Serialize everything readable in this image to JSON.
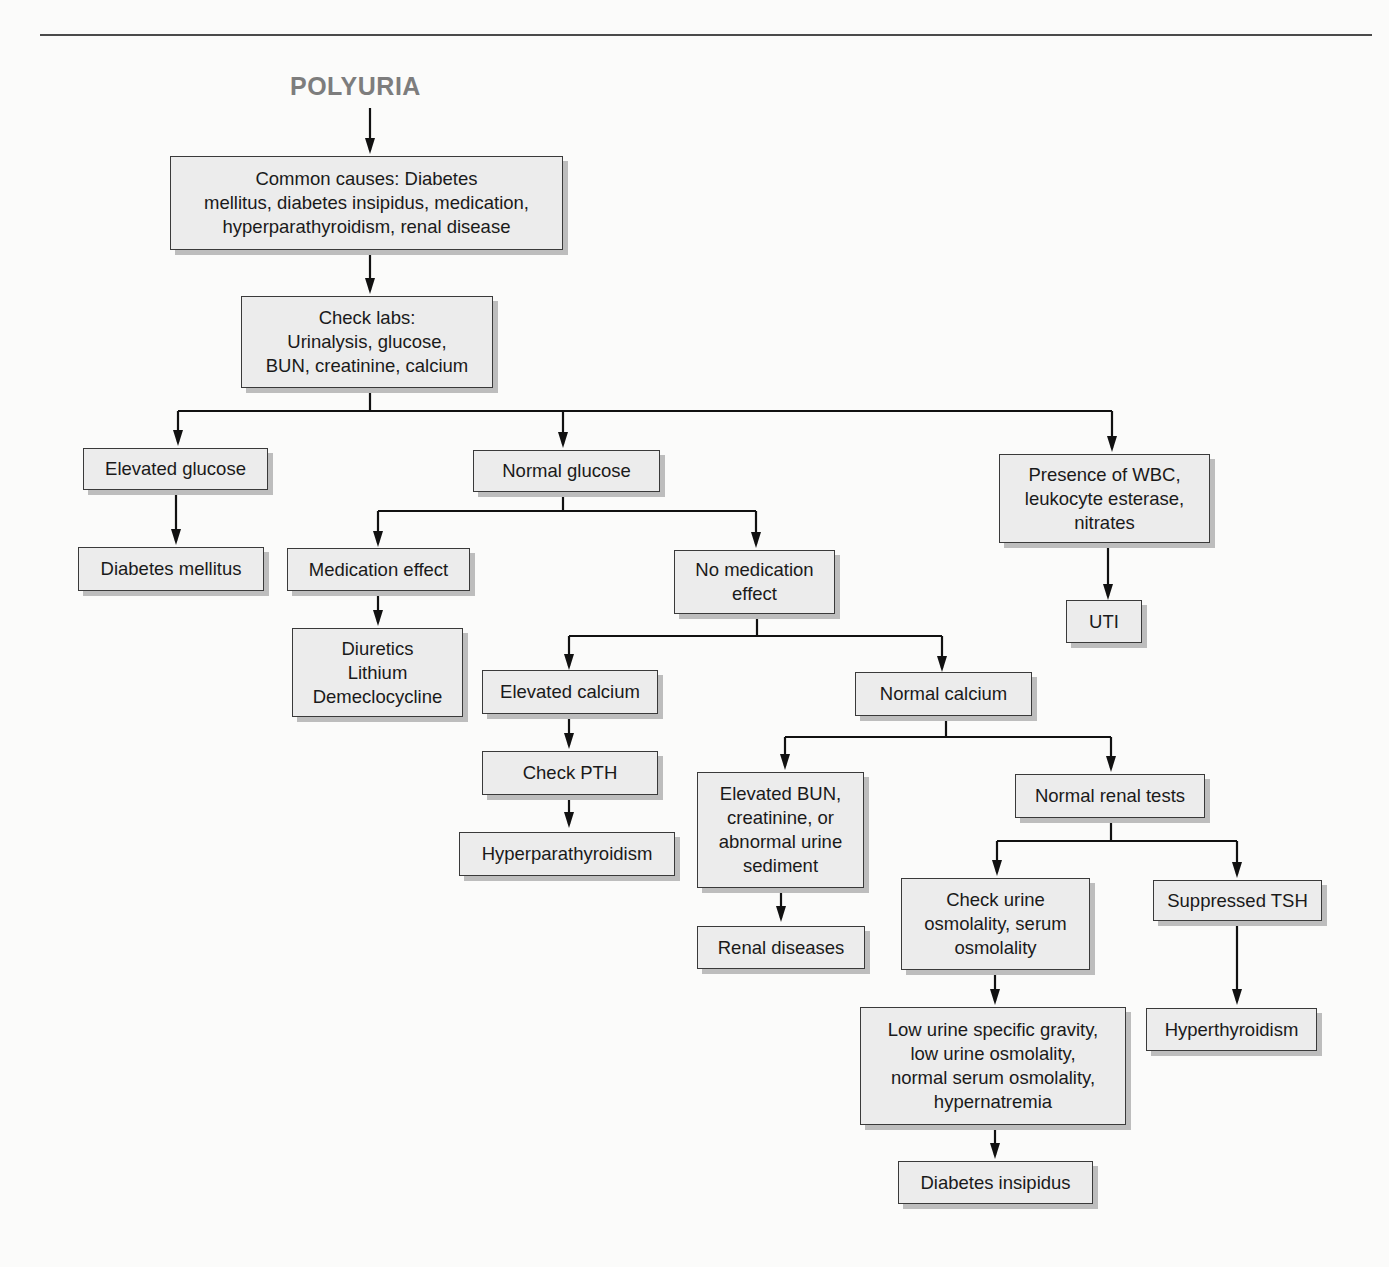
{
  "title": "POLYURIA",
  "nodes": {
    "common_causes": "Common causes: Diabetes\nmellitus, diabetes insipidus, medication,\nhyperparathyroidism, renal disease",
    "check_labs": "Check labs:\nUrinalysis, glucose,\nBUN, creatinine, calcium",
    "elevated_glucose": "Elevated glucose",
    "normal_glucose": "Normal glucose",
    "wbc": "Presence of WBC,\nleukocyte esterase,\nnitrates",
    "diabetes_mellitus": "Diabetes mellitus",
    "medication_effect": "Medication effect",
    "no_medication_effect": "No medication\neffect",
    "uti": "UTI",
    "drugs": "Diuretics\nLithium\nDemeclocycline",
    "elevated_calcium": "Elevated calcium",
    "normal_calcium": "Normal calcium",
    "check_pth": "Check PTH",
    "hyperparathyroidism": "Hyperparathyroidism",
    "elevated_bun": "Elevated BUN,\ncreatinine, or\nabnormal urine\nsediment",
    "normal_renal": "Normal renal tests",
    "renal_diseases": "Renal diseases",
    "check_osm": "Check urine\nosmolality, serum\nosmolality",
    "suppressed_tsh": "Suppressed TSH",
    "low_sg": "Low urine specific gravity,\nlow urine osmolality,\nnormal serum osmolality,\nhypernatremia",
    "hyperthyroidism": "Hyperthyroidism",
    "diabetes_insipidus": "Diabetes insipidus"
  }
}
